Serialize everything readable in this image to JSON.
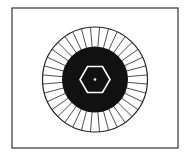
{
  "diagram": {
    "frame": {
      "x": 12,
      "y": 8,
      "width": 166,
      "height": 140,
      "stroke": "#333333"
    },
    "center": {
      "x": 95,
      "y": 79.5
    },
    "outer_ring": {
      "radius": 52.5,
      "stroke": "#222222",
      "fill": "#ffffff"
    },
    "inner_disc": {
      "radius": 33,
      "fill": "#111111"
    },
    "spokes": {
      "count": 36,
      "stroke": "#222222"
    },
    "hexagon": {
      "radius": 15,
      "stroke": "#ffffff",
      "orientation": "pointy-sides"
    },
    "center_dot": {
      "radius": 1.3,
      "fill": "#ffffff"
    }
  },
  "caption": {
    "text": ""
  }
}
